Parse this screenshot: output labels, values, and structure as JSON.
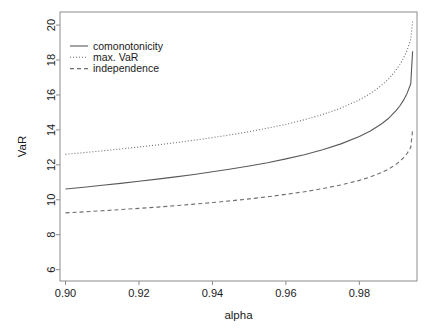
{
  "chart_data": {
    "type": "line",
    "title": "",
    "xlabel": "alpha",
    "ylabel": "VaR",
    "xlim": [
      0.8985,
      0.9957
    ],
    "ylim": [
      5.35,
      20.75
    ],
    "grid": false,
    "legend_position": "top-left",
    "xticks": [
      0.9,
      0.92,
      0.94,
      0.96,
      0.98
    ],
    "xtick_labels": [
      "0.90",
      "0.92",
      "0.94",
      "0.96",
      "0.98"
    ],
    "yticks": [
      6,
      8,
      10,
      12,
      14,
      16,
      18,
      20
    ],
    "ytick_labels": [
      "6",
      "8",
      "10",
      "12",
      "14",
      "16",
      "18",
      "20"
    ],
    "x": [
      0.9,
      0.905,
      0.91,
      0.915,
      0.92,
      0.925,
      0.93,
      0.935,
      0.94,
      0.945,
      0.95,
      0.955,
      0.96,
      0.965,
      0.97,
      0.975,
      0.98,
      0.983,
      0.986,
      0.988,
      0.99,
      0.991,
      0.992,
      0.993,
      0.994,
      0.9945
    ],
    "series": [
      {
        "name": "max. VaR",
        "style": "dotted",
        "color": "#6e6e6e",
        "values": [
          12.6,
          12.7,
          12.8,
          12.91,
          13.02,
          13.14,
          13.27,
          13.41,
          13.56,
          13.72,
          13.9,
          14.1,
          14.32,
          14.58,
          14.88,
          15.25,
          15.72,
          16.08,
          16.54,
          16.92,
          17.42,
          17.73,
          18.1,
          18.56,
          19.2,
          20.2
        ]
      },
      {
        "name": "comonotonicity",
        "style": "solid",
        "color": "#5a5a5a",
        "values": [
          10.62,
          10.72,
          10.83,
          10.94,
          11.06,
          11.18,
          11.31,
          11.45,
          11.6,
          11.76,
          11.93,
          12.12,
          12.34,
          12.58,
          12.86,
          13.2,
          13.62,
          13.94,
          14.34,
          14.67,
          15.1,
          15.37,
          15.69,
          16.09,
          16.64,
          18.5
        ]
      },
      {
        "name": "independence",
        "style": "dashed",
        "color": "#6e6e6e",
        "values": [
          9.25,
          9.31,
          9.37,
          9.44,
          9.51,
          9.58,
          9.66,
          9.75,
          9.84,
          9.94,
          10.05,
          10.17,
          10.31,
          10.46,
          10.64,
          10.85,
          11.11,
          11.31,
          11.56,
          11.76,
          12.03,
          12.2,
          12.4,
          12.65,
          13.0,
          14.0
        ]
      }
    ],
    "legend_entries": [
      {
        "label": "comonotonicity",
        "style": "solid"
      },
      {
        "label": "max. VaR",
        "style": "dotted"
      },
      {
        "label": "independence",
        "style": "dashed"
      }
    ]
  },
  "plot_box": {
    "left": 60,
    "right": 417,
    "top": 12,
    "bottom": 281
  },
  "colors": {
    "background": "#ffffff",
    "axis": "#8c8c8c",
    "text": "#1a1a1a",
    "line_solid": "#5a5a5a",
    "line_dotted": "#6e6e6e",
    "line_dashed": "#6e6e6e"
  }
}
